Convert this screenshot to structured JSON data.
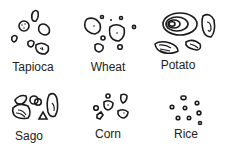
{
  "diagram": {
    "title": "",
    "panels": [
      {
        "id": "tapioca",
        "label": "Tapioca"
      },
      {
        "id": "wheat",
        "label": "Wheat"
      },
      {
        "id": "potato",
        "label": "Potato"
      },
      {
        "id": "sago",
        "label": "Sago"
      },
      {
        "id": "corn",
        "label": "Corn"
      },
      {
        "id": "rice",
        "label": "Rice"
      }
    ],
    "colors": {
      "ink": "#1a1a1a",
      "background": "#ffffff"
    }
  }
}
